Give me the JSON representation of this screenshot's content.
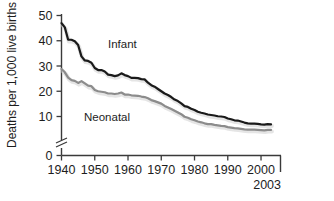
{
  "chart_data": {
    "type": "line",
    "title": "",
    "subtitle": "",
    "xlabel": "",
    "ylabel": "Deaths per 1,000 live births",
    "xlim": [
      1940,
      2003
    ],
    "ylim": [
      0,
      50
    ],
    "yticks": [
      0,
      10,
      20,
      30,
      40,
      50
    ],
    "xticks": [
      1940,
      1950,
      1960,
      1970,
      1980,
      1990,
      2000
    ],
    "xtick_labels": [
      "1940",
      "1950",
      "1960",
      "1970",
      "1980",
      "1990",
      "2000"
    ],
    "ytick_labels": [
      "0",
      "10",
      "20",
      "30",
      "40",
      "50"
    ],
    "axis_break": true,
    "axis_break_between": [
      0,
      10
    ],
    "grid": false,
    "legend_position": "inline-annotation",
    "end_marker_label": "2003",
    "annotations": [
      {
        "text": "Infant",
        "x": 1952,
        "y": 33
      },
      {
        "text": "Neonatal",
        "x": 1952,
        "y": 15
      }
    ],
    "x": [
      1940,
      1941,
      1942,
      1943,
      1944,
      1945,
      1946,
      1947,
      1948,
      1949,
      1950,
      1951,
      1952,
      1953,
      1954,
      1955,
      1956,
      1957,
      1958,
      1959,
      1960,
      1961,
      1962,
      1963,
      1964,
      1965,
      1966,
      1967,
      1968,
      1969,
      1970,
      1971,
      1972,
      1973,
      1974,
      1975,
      1976,
      1977,
      1978,
      1979,
      1980,
      1981,
      1982,
      1983,
      1984,
      1985,
      1986,
      1987,
      1988,
      1989,
      1990,
      1991,
      1992,
      1993,
      1994,
      1995,
      1996,
      1997,
      1998,
      1999,
      2000,
      2001,
      2002,
      2003
    ],
    "series": [
      {
        "name": "Infant",
        "color": "#1a1a1a",
        "values": [
          47.0,
          45.3,
          40.4,
          40.4,
          39.8,
          38.3,
          33.8,
          32.2,
          32.0,
          31.3,
          29.2,
          28.4,
          28.4,
          27.8,
          26.6,
          26.4,
          26.0,
          26.3,
          27.1,
          26.4,
          26.0,
          25.3,
          25.3,
          25.2,
          24.8,
          24.7,
          23.4,
          22.4,
          21.8,
          20.9,
          20.0,
          19.1,
          18.5,
          17.7,
          16.7,
          16.1,
          15.2,
          14.1,
          13.8,
          13.1,
          12.6,
          11.9,
          11.5,
          11.2,
          10.8,
          10.6,
          10.4,
          10.1,
          10.0,
          9.8,
          9.2,
          8.9,
          8.5,
          8.4,
          8.0,
          7.6,
          7.3,
          7.2,
          7.2,
          7.1,
          6.9,
          6.8,
          7.0,
          6.9
        ]
      },
      {
        "name": "Neonatal",
        "color": "#8c8c8c",
        "values": [
          28.8,
          27.5,
          25.4,
          24.4,
          24.1,
          23.3,
          24.0,
          23.1,
          22.2,
          22.0,
          20.5,
          20.0,
          19.8,
          19.6,
          19.1,
          19.1,
          18.9,
          19.1,
          19.5,
          18.7,
          18.7,
          18.4,
          18.3,
          18.2,
          17.9,
          17.7,
          17.2,
          16.5,
          16.1,
          15.6,
          15.1,
          14.2,
          13.6,
          13.0,
          12.3,
          11.6,
          10.9,
          9.9,
          9.5,
          8.9,
          8.5,
          8.0,
          7.7,
          7.3,
          7.0,
          7.0,
          6.7,
          6.5,
          6.3,
          6.2,
          5.8,
          5.6,
          5.4,
          5.3,
          5.1,
          4.9,
          4.8,
          4.8,
          4.8,
          4.7,
          4.6,
          4.5,
          4.7,
          4.7
        ]
      }
    ]
  }
}
